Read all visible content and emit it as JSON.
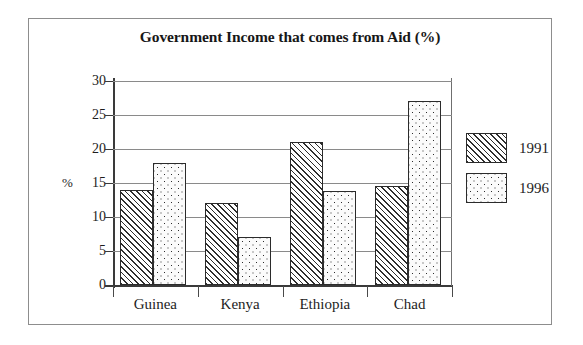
{
  "chart_data": {
    "type": "bar",
    "title": "Government Income that comes from Aid (%)",
    "xlabel": "",
    "ylabel": "%",
    "categories": [
      "Guinea",
      "Kenya",
      "Ethiopia",
      "Chad"
    ],
    "series": [
      {
        "name": "1991",
        "values": [
          14,
          12,
          21,
          14.5
        ],
        "pattern": "diagonal-hatch"
      },
      {
        "name": "1996",
        "values": [
          18,
          7,
          13.8,
          27
        ],
        "pattern": "dots"
      }
    ],
    "ylim": [
      0,
      30
    ],
    "yticks": [
      "0",
      "5",
      "10",
      "15",
      "20",
      "25",
      "30"
    ],
    "ytick_values": [
      0,
      5,
      10,
      15,
      20,
      25,
      30
    ],
    "grid": true,
    "legend_position": "right"
  },
  "legend": {
    "entries": [
      {
        "label": "1991"
      },
      {
        "label": "1996"
      }
    ]
  },
  "colors": {
    "frame": "#8d8d8d",
    "axis": "#3a3a3a",
    "gridline": "#8a8a8a",
    "bar_outline": "#2b2b2b",
    "text": "#1d1d1d",
    "background": "#ffffff"
  }
}
